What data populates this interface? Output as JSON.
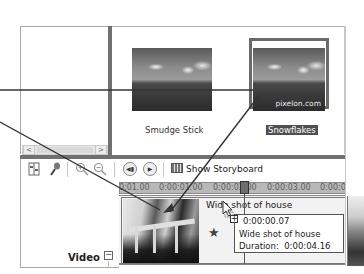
{
  "contents": {
    "items": [
      {
        "caption": "Smudge Stick",
        "selected": false
      },
      {
        "caption": "Snowflakes",
        "selected": true,
        "watermark": "pixelon.com"
      }
    ]
  },
  "collections_scrollbar": {
    "left_arrow": "<",
    "right_arrow": ">"
  },
  "toolbar": {
    "icons": [
      "set-audio-levels-icon",
      "narrate-timeline-icon",
      "zoom-in-icon",
      "zoom-out-icon",
      "rewind-icon",
      "play-icon"
    ],
    "storyboard_label": "Show Storyboard"
  },
  "ruler": {
    "ticks": [
      "0:00:01.00",
      "0:00:01.00",
      "0:00:02.00",
      "0:00:03.00",
      "0:00:04"
    ]
  },
  "timeline": {
    "track_label": "Video",
    "collapse_symbol": "−",
    "clip_title": "Wide shot of house",
    "star_symbol": "★"
  },
  "tooltip": {
    "plus_symbol": "+",
    "time": "0:00:00.07",
    "name": "Wide shot of house",
    "duration_label": "Duration:",
    "duration_value": "0:00:04.16"
  }
}
